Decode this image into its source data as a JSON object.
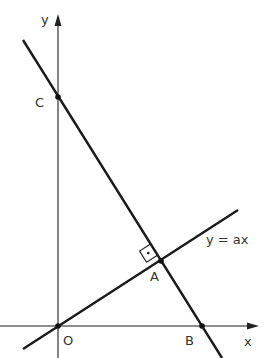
{
  "diagram": {
    "type": "coordinate-geometry",
    "axes": {
      "x_label": "x",
      "y_label": "y",
      "origin_label": "O"
    },
    "points": {
      "O": {
        "label": "O",
        "px": [
          58,
          326
        ]
      },
      "A": {
        "label": "A",
        "px": [
          161,
          261
        ]
      },
      "B": {
        "label": "B",
        "px": [
          202,
          326
        ]
      },
      "C": {
        "label": "C",
        "px": [
          58,
          97
        ]
      }
    },
    "lines": [
      {
        "name": "y = ax",
        "label": "y = ax",
        "through": [
          "O",
          "A"
        ]
      },
      {
        "name": "CB",
        "through": [
          "C",
          "A",
          "B"
        ]
      }
    ],
    "right_angle_marker": {
      "at": "A",
      "symbol": "·"
    },
    "colors": {
      "line": "#1a1a1a",
      "axis": "#555555",
      "text": "#333333"
    }
  }
}
